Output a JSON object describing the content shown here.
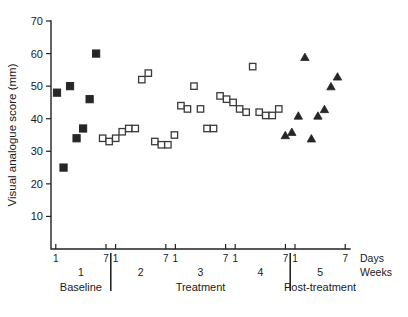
{
  "chart_data": {
    "type": "scatter",
    "title": "",
    "xlabel": "",
    "ylabel": "Visual analogue score (mm)",
    "ylim": [
      0,
      70
    ],
    "yticks": [
      10,
      20,
      30,
      40,
      50,
      60,
      70
    ],
    "grid": false,
    "legend_position": "none",
    "x_unit_labels": [
      "Days",
      "Weeks"
    ],
    "x_week_labels": [
      "1",
      "2",
      "3",
      "4",
      "5"
    ],
    "x_day_tick_labels": [
      "1",
      "7",
      "1",
      "7",
      "1",
      "7",
      "1",
      "7",
      "1",
      "7"
    ],
    "phases": [
      {
        "name": "Baseline",
        "weeks": [
          1
        ]
      },
      {
        "name": "Treatment",
        "weeks": [
          2,
          3,
          4
        ]
      },
      {
        "name": "Post-treatment",
        "weeks": [
          5
        ]
      }
    ],
    "series": [
      {
        "name": "Baseline",
        "marker": "filled-square",
        "color": "#262626",
        "points": [
          {
            "day": 1,
            "value": 48
          },
          {
            "day": 2,
            "value": 25
          },
          {
            "day": 3,
            "value": 50
          },
          {
            "day": 4,
            "value": 34
          },
          {
            "day": 5,
            "value": 37
          },
          {
            "day": 6,
            "value": 46
          },
          {
            "day": 7,
            "value": 60
          }
        ]
      },
      {
        "name": "Treatment",
        "marker": "open-square",
        "color": "#3a3a3a",
        "points": [
          {
            "day": 8,
            "value": 34
          },
          {
            "day": 9,
            "value": 33
          },
          {
            "day": 10,
            "value": 34
          },
          {
            "day": 11,
            "value": 36
          },
          {
            "day": 12,
            "value": 37
          },
          {
            "day": 13,
            "value": 37
          },
          {
            "day": 14,
            "value": 52
          },
          {
            "day": 15,
            "value": 54
          },
          {
            "day": 16,
            "value": 33
          },
          {
            "day": 17,
            "value": 32
          },
          {
            "day": 18,
            "value": 32
          },
          {
            "day": 19,
            "value": 35
          },
          {
            "day": 20,
            "value": 44
          },
          {
            "day": 21,
            "value": 43
          },
          {
            "day": 22,
            "value": 50
          },
          {
            "day": 23,
            "value": 43
          },
          {
            "day": 24,
            "value": 37
          },
          {
            "day": 25,
            "value": 37
          },
          {
            "day": 26,
            "value": 47
          },
          {
            "day": 27,
            "value": 46
          },
          {
            "day": 28,
            "value": 45
          },
          {
            "day": 29,
            "value": 43
          },
          {
            "day": 30,
            "value": 42
          },
          {
            "day": 31,
            "value": 56
          },
          {
            "day": 32,
            "value": 42
          },
          {
            "day": 33,
            "value": 41
          },
          {
            "day": 34,
            "value": 41
          },
          {
            "day": 35,
            "value": 43
          }
        ]
      },
      {
        "name": "Post-treatment",
        "marker": "filled-triangle",
        "color": "#262626",
        "points": [
          {
            "day": 36,
            "value": 35
          },
          {
            "day": 37,
            "value": 36
          },
          {
            "day": 38,
            "value": 41
          },
          {
            "day": 39,
            "value": 59
          },
          {
            "day": 40,
            "value": 34
          },
          {
            "day": 41,
            "value": 41
          },
          {
            "day": 42,
            "value": 43
          },
          {
            "day": 43,
            "value": 50
          },
          {
            "day": 44,
            "value": 53
          }
        ]
      }
    ]
  }
}
